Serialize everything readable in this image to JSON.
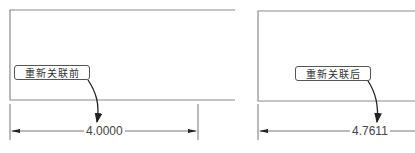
{
  "colors": {
    "line": "#777777",
    "text": "#444444",
    "arrow": "#222222"
  },
  "panels": [
    {
      "label": "重新关联前",
      "dimension": "4.0000"
    },
    {
      "label": "重新关联后",
      "dimension": "4.7611"
    }
  ]
}
